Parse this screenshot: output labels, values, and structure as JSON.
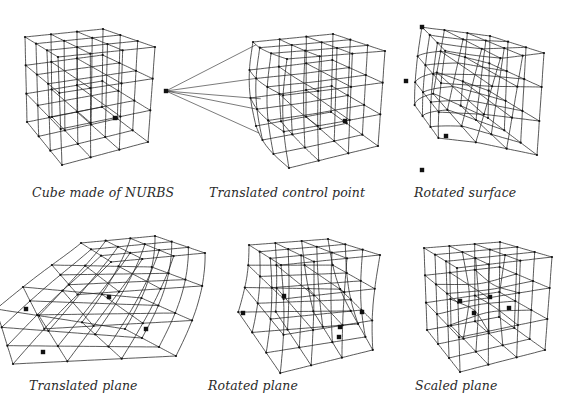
{
  "figures": [
    {
      "id": "cube",
      "caption": "Cube made of NURBS",
      "caption_pos": [
        32,
        185
      ],
      "corners": {
        "A": [
          25,
          37
        ],
        "B": [
          103,
          29
        ],
        "C": [
          58,
          57
        ],
        "D": [
          155,
          47
        ],
        "E": [
          27,
          122
        ],
        "F": [
          102,
          107
        ],
        "G": [
          62,
          165
        ],
        "H": [
          148,
          142
        ]
      },
      "deform": "none",
      "big_points": [
        [
          115,
          118
        ]
      ]
    },
    {
      "id": "translated-control-point",
      "caption": "Translated control point",
      "caption_pos": [
        209,
        185
      ],
      "corners": {
        "A": [
          253,
          42
        ],
        "B": [
          333,
          34
        ],
        "C": [
          287,
          59
        ],
        "D": [
          385,
          51
        ],
        "E": [
          256,
          126
        ],
        "F": [
          331,
          112
        ],
        "G": [
          289,
          168
        ],
        "H": [
          378,
          146
        ]
      },
      "deform": "pull",
      "pull_point": [
        166,
        91
      ],
      "big_points": [
        [
          166,
          91
        ],
        [
          345,
          121
        ]
      ]
    },
    {
      "id": "rotated-surface",
      "caption": "Rotated surface",
      "caption_pos": [
        414,
        185
      ],
      "corners": {
        "A": [
          422,
          27
        ],
        "B": [
          490,
          36
        ],
        "C": [
          480,
          61
        ],
        "D": [
          544,
          53
        ],
        "E": [
          406,
          81
        ],
        "F": [
          488,
          118
        ],
        "G": [
          446,
          136
        ],
        "H": [
          537,
          155
        ]
      },
      "deform": "rotate",
      "extra_corner": [
        422,
        170
      ],
      "big_points": [
        [
          422,
          27
        ],
        [
          406,
          81
        ],
        [
          446,
          136
        ],
        [
          422,
          170
        ]
      ]
    },
    {
      "id": "translated-plane",
      "caption": "Translated plane",
      "caption_pos": [
        29,
        378
      ],
      "corners": {
        "A": [
          81,
          243
        ],
        "B": [
          155,
          236
        ],
        "C": [
          111,
          262
        ],
        "D": [
          205,
          253
        ],
        "E": [
          26,
          309
        ],
        "F": [
          146,
          329
        ],
        "G": [
          43,
          352
        ],
        "H": [
          197,
          344
        ]
      },
      "deform": "plane",
      "big_points": [
        [
          26,
          309
        ],
        [
          43,
          352
        ],
        [
          109,
          297
        ],
        [
          146,
          329
        ]
      ]
    },
    {
      "id": "rotated-plane",
      "caption": "Rotated plane",
      "caption_pos": [
        208,
        378
      ],
      "corners": {
        "A": [
          249,
          245
        ],
        "B": [
          328,
          239
        ],
        "C": [
          281,
          265
        ],
        "D": [
          380,
          255
        ],
        "E": [
          243,
          313
        ],
        "F": [
          352,
          310
        ],
        "G": [
          285,
          374
        ],
        "H": [
          374,
          349
        ]
      },
      "deform": "plane-rot",
      "big_points": [
        [
          243,
          313
        ],
        [
          284,
          296
        ],
        [
          362,
          312
        ],
        [
          339,
          337
        ],
        [
          340,
          327
        ]
      ]
    },
    {
      "id": "scaled-plane",
      "caption": "Scaled plane",
      "caption_pos": [
        415,
        378
      ],
      "corners": {
        "A": [
          424,
          248
        ],
        "B": [
          500,
          242
        ],
        "C": [
          457,
          268
        ],
        "D": [
          552,
          257
        ],
        "E": [
          427,
          330
        ],
        "F": [
          499,
          317
        ],
        "G": [
          460,
          372
        ],
        "H": [
          545,
          350
        ]
      },
      "deform": "scale",
      "big_points": [
        [
          460,
          301
        ],
        [
          490,
          297
        ],
        [
          474,
          313
        ],
        [
          509,
          308
        ]
      ]
    }
  ],
  "style": {
    "line_color": "#222222",
    "point_color": "#111111",
    "background": "#ffffff"
  }
}
